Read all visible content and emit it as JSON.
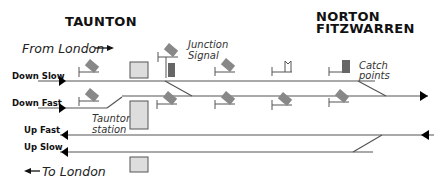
{
  "titles": {
    "left_station": "TAUNTON",
    "right_station_line1": "NORTON",
    "right_station_line2": "FITZWARREN"
  },
  "directions": {
    "from_london": "From London",
    "to_london": "To London"
  },
  "tracks": {
    "down_slow": "Down Slow",
    "down_fast": "Down Fast",
    "up_fast": "Up Fast",
    "up_slow": "Up Slow"
  },
  "annotations": {
    "junction_signal_line1": "Junction",
    "junction_signal_line2": "Signal",
    "catch_points_line1": "Catch",
    "catch_points_line2": "points",
    "taunton_station_line1": "Taunton",
    "taunton_station_line2": "station"
  },
  "colors": {
    "track": "#555555",
    "signal_arm": "#888888",
    "platform_fill": "#dddddd",
    "platform_stroke": "#555555",
    "junction_signal_box": "#666666",
    "arrow": "#000000"
  }
}
